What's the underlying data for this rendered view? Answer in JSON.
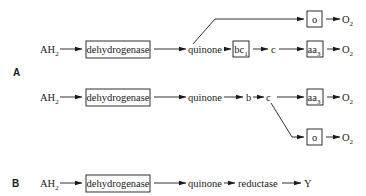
{
  "panels": {
    "A": {
      "label": "A",
      "pathway1": {
        "donor": "AH",
        "donor_sub": "2",
        "dehydrogenase": "dehydrogenase",
        "quinone": "quinone",
        "bc1": "bc",
        "bc1_sub": "1",
        "c": "c",
        "aa3": "aa",
        "aa3_sub": "3",
        "o": "o",
        "o2_main": "O",
        "o2_main_sub": "2",
        "o2_branch": "O",
        "o2_branch_sub": "2"
      },
      "pathway2": {
        "donor": "AH",
        "donor_sub": "2",
        "dehydrogenase": "dehydrogenase",
        "quinone": "quinone",
        "b": "b",
        "c": "c",
        "aa3": "aa",
        "aa3_sub": "3",
        "o": "o",
        "o2_main": "O",
        "o2_main_sub": "2",
        "o2_branch": "O",
        "o2_branch_sub": "2"
      }
    },
    "B": {
      "label": "B",
      "pathway": {
        "donor": "AH",
        "donor_sub": "2",
        "dehydrogenase": "dehydrogenase",
        "quinone": "quinone",
        "reductase": "reductase",
        "acceptor": "Y"
      }
    }
  }
}
